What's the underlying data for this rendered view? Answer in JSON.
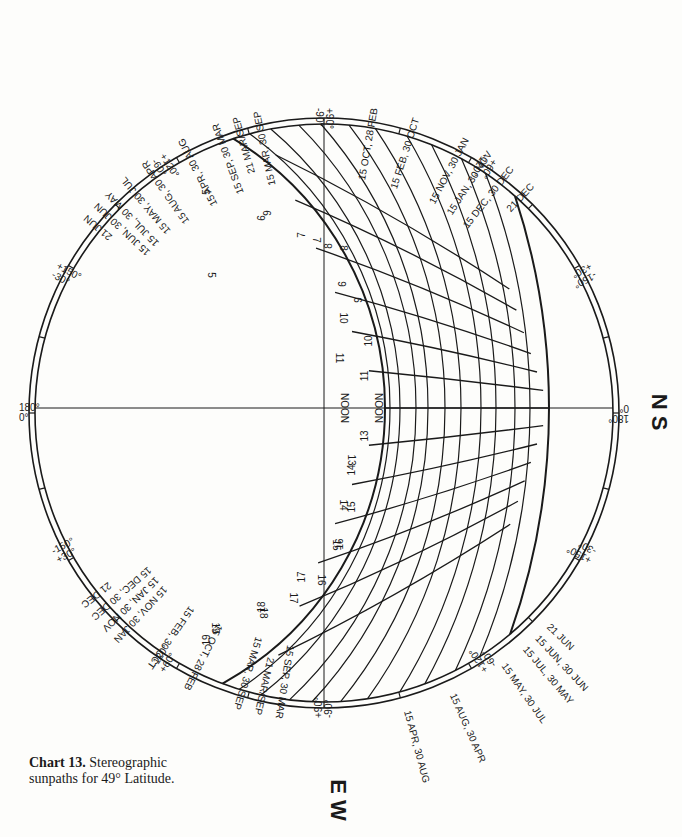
{
  "caption": {
    "bold": "Chart 13.",
    "text": " Stereographic sunpaths for 49° Latitude."
  },
  "compass": {
    "right": "N S",
    "bottom": "E W"
  },
  "chart_data": {
    "type": "diagram",
    "title": "Stereographic sunpaths for 49° Latitude",
    "latitude": 49,
    "azimuth_labels": [
      {
        "angle_from_top_deg": 0,
        "lines": [
          "+90°",
          "-90°"
        ],
        "side": "top"
      },
      {
        "angle_from_top_deg": 180,
        "lines": [
          "+90°",
          "-90°"
        ],
        "side": "bottom"
      },
      {
        "angle_from_top_deg": 33,
        "lines": [
          "+60°",
          "-120°"
        ],
        "side": "top-right"
      },
      {
        "angle_from_top_deg": -33,
        "lines": [
          "+120°",
          "-60°"
        ],
        "side": "top-left"
      },
      {
        "angle_from_top_deg": 147,
        "lines": [
          "+120°",
          "-60°"
        ],
        "side": "bottom-right"
      },
      {
        "angle_from_top_deg": -147,
        "lines": [
          "-120°",
          "+60°"
        ],
        "side": "bottom-left"
      },
      {
        "angle_from_top_deg": 62,
        "lines": [
          "-150°",
          "+30°"
        ],
        "side": "right-upper"
      },
      {
        "angle_from_top_deg": 118,
        "lines": [
          "+150°",
          "-30°"
        ],
        "side": "right-lower"
      },
      {
        "angle_from_top_deg": -62,
        "lines": [
          "+150°",
          "-30°"
        ],
        "side": "left-upper"
      },
      {
        "angle_from_top_deg": -118,
        "lines": [
          "-150°",
          "+30°"
        ],
        "side": "left-lower"
      },
      {
        "angle_from_top_deg": 90,
        "lines": [
          "180°",
          "0°"
        ],
        "side": "right"
      },
      {
        "angle_from_top_deg": -90,
        "lines": [
          "180°",
          "0°"
        ],
        "side": "left"
      }
    ],
    "date_labels_top": [
      "21 JUN",
      "15 JUN, 30 JUN",
      "15 JUL, 30 MAY",
      "15 MAY, 30 JUL",
      "15 AUG, 30 APR",
      "15 APR, 30 AUG",
      "15 SEP, 30 MAR",
      "21 MAR/SEP",
      "15 MAR, 30 SEP",
      "15 OCT, 28 FEB",
      "15 FEB, 30 OCT",
      "15 NOV, 30 JAN",
      "15 JAN, 30 NOV",
      "15 DEC, 30 DEC",
      "21 DEC"
    ],
    "date_labels_bottom_left": [
      "21 DEC",
      "15 DEC, 30 DEC",
      "15 JAN, 30 NOV",
      "15 NOV, 30 JAN",
      "15 FEB, 30 OCT",
      "15 OCT, 28 FEB",
      "15 MAR, 30 SEP",
      "21 MAR/SEP",
      "15 SEP, 30 MAR"
    ],
    "date_labels_bottom_right": [
      "15 APR, 30 AUG",
      "15 AUG, 30 APR",
      "15 MAY, 30 JUL",
      "15 JUL, 30 MAY",
      "15 JUN, 30 JUN",
      "21 JUN"
    ],
    "hour_labels_outer_arc": [
      "5",
      "6",
      "7",
      "8",
      "9",
      "10",
      "11",
      "NOON",
      "13",
      "14",
      "15",
      "16",
      "17",
      "18",
      "19"
    ],
    "hour_labels_inner_arc": [
      "19",
      "18",
      "17",
      "16",
      "15",
      "14",
      "13",
      "NOON",
      "11",
      "10",
      "9",
      "8",
      "7",
      "6",
      "5"
    ],
    "center_label": "NOON"
  }
}
